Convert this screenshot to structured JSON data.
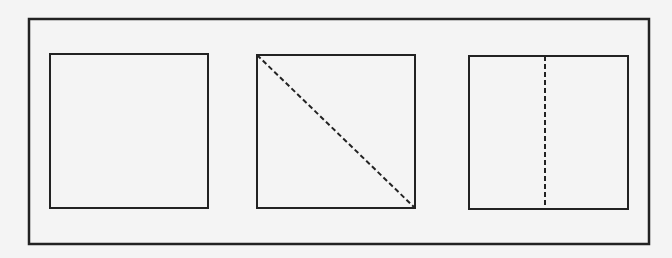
{
  "diagram": {
    "colors": {
      "background": "#f4f4f4",
      "stroke": "#222222"
    },
    "frame": {
      "x": 29,
      "y": 19,
      "w": 620,
      "h": 225
    },
    "squares": [
      {
        "id": "plain",
        "x": 50,
        "y": 54,
        "w": 158,
        "h": 154,
        "fold": "none"
      },
      {
        "id": "diagonal",
        "x": 257,
        "y": 55,
        "w": 158,
        "h": 153,
        "fold": "diagonal"
      },
      {
        "id": "vertical",
        "x": 469,
        "y": 56,
        "w": 159,
        "h": 153,
        "fold": "vertical"
      }
    ]
  }
}
